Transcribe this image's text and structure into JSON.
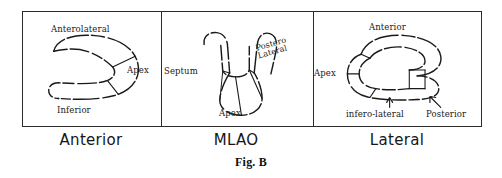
{
  "figure": {
    "caption": "Fig. B"
  },
  "panels": [
    {
      "id": "anterior",
      "view_label": "Anterior",
      "annotations": [
        {
          "name": "anterolateral",
          "text": "Anterolateral"
        },
        {
          "name": "apex",
          "text": "Apex"
        },
        {
          "name": "inferior",
          "text": "Inferior"
        }
      ]
    },
    {
      "id": "mlao",
      "view_label": "MLAO",
      "annotations": [
        {
          "name": "septum",
          "text": "Septum"
        },
        {
          "name": "postero",
          "text": "Postero"
        },
        {
          "name": "lateral",
          "text": "Lateral"
        },
        {
          "name": "apex",
          "text": "Apex"
        }
      ]
    },
    {
      "id": "lateral",
      "view_label": "Lateral",
      "annotations": [
        {
          "name": "anterior",
          "text": "Anterior"
        },
        {
          "name": "apex",
          "text": "Apex"
        },
        {
          "name": "infero-lateral",
          "text": "infero-lateral"
        },
        {
          "name": "posterior",
          "text": "Posterior"
        }
      ]
    }
  ],
  "style": {
    "ink": "#1a1a1a",
    "frame": "#2b2b2b",
    "background": "#ffffff"
  }
}
